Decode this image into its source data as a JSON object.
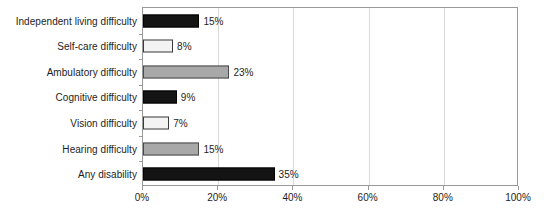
{
  "chart_data": {
    "type": "bar",
    "orientation": "horizontal",
    "title": "",
    "subtitle": "",
    "xlabel": "",
    "ylabel": "",
    "xlim": [
      0,
      100
    ],
    "xtick_labels": [
      "0%",
      "20%",
      "40%",
      "60%",
      "80%",
      "100%"
    ],
    "xtick_values": [
      0,
      20,
      40,
      60,
      80,
      100
    ],
    "grid": true,
    "grid_axis": "x",
    "legend": false,
    "legend_position": "none",
    "value_label_suffix": "%",
    "categories": [
      "Independent living difficulty",
      "Self-care difficulty",
      "Ambulatory difficulty",
      "Cognitive difficulty",
      "Vision difficulty",
      "Hearing difficulty",
      "Any disability"
    ],
    "values": [
      15,
      8,
      23,
      9,
      7,
      15,
      35
    ],
    "value_labels": [
      "15%",
      "8%",
      "23%",
      "9%",
      "7%",
      "15%",
      "35%"
    ],
    "bar_styles": [
      "dark",
      "light",
      "gray",
      "dark",
      "light",
      "gray",
      "dark"
    ],
    "colors": {
      "dark_fill": "#141414",
      "dark_edge": "#000000",
      "light_fill": "#f3f3f3",
      "light_edge": "#3a3a3a",
      "gray_fill": "#a8a8a8",
      "gray_edge": "#4a4a4a",
      "gridline": "#d9d9d9",
      "frame": "#9a9a9a",
      "text": "#1d1d1d",
      "background": "#ffffff"
    }
  }
}
